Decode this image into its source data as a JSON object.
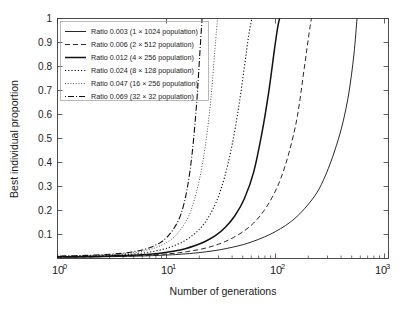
{
  "chart_data": {
    "type": "line",
    "title": "",
    "xlabel": "Number of generations",
    "ylabel": "Best individual proportion",
    "xscale": "log",
    "yscale": "linear",
    "xlim": [
      1,
      3000
    ],
    "ylim": [
      0,
      1
    ],
    "grid": false,
    "legend_position": "upper-left",
    "xticks": [
      "10^0",
      "10^1",
      "10^2",
      "10^3"
    ],
    "xtick_labels": [
      "10",
      "10",
      "10",
      "10"
    ],
    "xtick_exponents": [
      "0",
      "1",
      "2",
      "3"
    ],
    "yticks": [
      0.1,
      0.2,
      0.3,
      0.4,
      0.5,
      0.6,
      0.7,
      0.8,
      0.9,
      1
    ],
    "ytick_labels": [
      "0.1",
      "0.2",
      "0.3",
      "0.4",
      "0.5",
      "0.6",
      "0.7",
      "0.8",
      "0.9",
      "1"
    ],
    "series": [
      {
        "name": "Ratio 0.003 (1 × 1024 population)",
        "ratio": 0.003,
        "population": "1 × 1024",
        "linestyle": "solid",
        "color": "#111111",
        "x": [
          1,
          2,
          4,
          7,
          10,
          15,
          20,
          30,
          45,
          60,
          80,
          100,
          130,
          170,
          220,
          280,
          350,
          450,
          560,
          700,
          850,
          1000,
          1150,
          1300,
          1400
        ],
        "y": [
          0.005,
          0.006,
          0.008,
          0.01,
          0.012,
          0.015,
          0.018,
          0.024,
          0.033,
          0.042,
          0.053,
          0.064,
          0.08,
          0.1,
          0.124,
          0.152,
          0.186,
          0.235,
          0.29,
          0.375,
          0.47,
          0.57,
          0.69,
          0.85,
          1.0
        ]
      },
      {
        "name": "Ratio 0.006 (2 × 512 population)",
        "ratio": 0.006,
        "population": "2 × 512",
        "linestyle": "dashed",
        "color": "#111111",
        "x": [
          1,
          2,
          4,
          7,
          10,
          14,
          19,
          25,
          33,
          43,
          55,
          70,
          90,
          115,
          145,
          180,
          220,
          270,
          330,
          390,
          440,
          465
        ],
        "y": [
          0.006,
          0.007,
          0.009,
          0.012,
          0.015,
          0.019,
          0.024,
          0.031,
          0.04,
          0.052,
          0.067,
          0.087,
          0.113,
          0.148,
          0.195,
          0.255,
          0.33,
          0.44,
          0.59,
          0.79,
          0.94,
          1.0
        ]
      },
      {
        "name": "Ratio 0.012 (4 × 256 population)",
        "ratio": 0.012,
        "population": "4 × 256",
        "linestyle": "solid-thick",
        "color": "#111111",
        "x": [
          1,
          2,
          4,
          7,
          10,
          13,
          17,
          22,
          28,
          36,
          46,
          58,
          73,
          92,
          115,
          140,
          165,
          190,
          205,
          215
        ],
        "y": [
          0.007,
          0.008,
          0.011,
          0.015,
          0.019,
          0.024,
          0.031,
          0.041,
          0.054,
          0.072,
          0.096,
          0.13,
          0.178,
          0.25,
          0.36,
          0.52,
          0.69,
          0.87,
          0.96,
          1.0
        ]
      },
      {
        "name": "Ratio 0.024 (8 × 128 population)",
        "ratio": 0.024,
        "population": "8 × 128",
        "linestyle": "dotted",
        "color": "#111111",
        "x": [
          1,
          2,
          4,
          6,
          8,
          10,
          13,
          16,
          20,
          25,
          31,
          38,
          47,
          57,
          68,
          80,
          92,
          102,
          110
        ],
        "y": [
          0.008,
          0.01,
          0.014,
          0.018,
          0.023,
          0.029,
          0.039,
          0.05,
          0.066,
          0.09,
          0.122,
          0.168,
          0.24,
          0.34,
          0.47,
          0.63,
          0.8,
          0.93,
          1.0
        ]
      },
      {
        "name": "Ratio 0.047 (16 × 256 population)",
        "ratio": 0.047,
        "population": "16 × 256",
        "linestyle": "dotted-fine",
        "color": "#111111",
        "x": [
          1,
          2,
          4,
          6,
          8,
          10,
          12,
          15,
          18,
          22,
          26,
          31,
          36,
          41,
          45,
          48
        ],
        "y": [
          0.009,
          0.012,
          0.017,
          0.023,
          0.031,
          0.041,
          0.053,
          0.074,
          0.102,
          0.15,
          0.215,
          0.33,
          0.48,
          0.67,
          0.87,
          1.0
        ]
      },
      {
        "name": "Ratio 0.069 (32 × 32 population)",
        "ratio": 0.069,
        "population": "32 × 32",
        "linestyle": "dash-dot",
        "color": "#111111",
        "x": [
          1,
          2,
          4,
          6,
          8,
          10,
          12,
          14,
          17,
          20,
          23,
          26,
          29,
          31,
          33
        ],
        "y": [
          0.01,
          0.013,
          0.019,
          0.027,
          0.037,
          0.05,
          0.066,
          0.087,
          0.13,
          0.19,
          0.29,
          0.44,
          0.65,
          0.83,
          1.0
        ]
      }
    ]
  },
  "axes": {
    "y_title": "Best individual proportion",
    "x_title": "Number of generations"
  },
  "legend": {
    "items": [
      {
        "label": "Ratio 0.003 (1 × 1024 population)"
      },
      {
        "label": "Ratio 0.006 (2 × 512 population)"
      },
      {
        "label": "Ratio 0.012 (4 × 256 population)"
      },
      {
        "label": "Ratio 0.024 (8 × 128 population)"
      },
      {
        "label": "Ratio 0.047 (16 × 256 population)"
      },
      {
        "label": "Ratio 0.069 (32 × 32 population)"
      }
    ]
  },
  "ticks": {
    "y": [
      "1",
      "0.9",
      "0.8",
      "0.7",
      "0.6",
      "0.5",
      "0.4",
      "0.3",
      "0.2",
      "0.1"
    ],
    "x_base": [
      "10",
      "10",
      "10",
      "10"
    ],
    "x_exp": [
      "0",
      "1",
      "2",
      "3"
    ]
  }
}
